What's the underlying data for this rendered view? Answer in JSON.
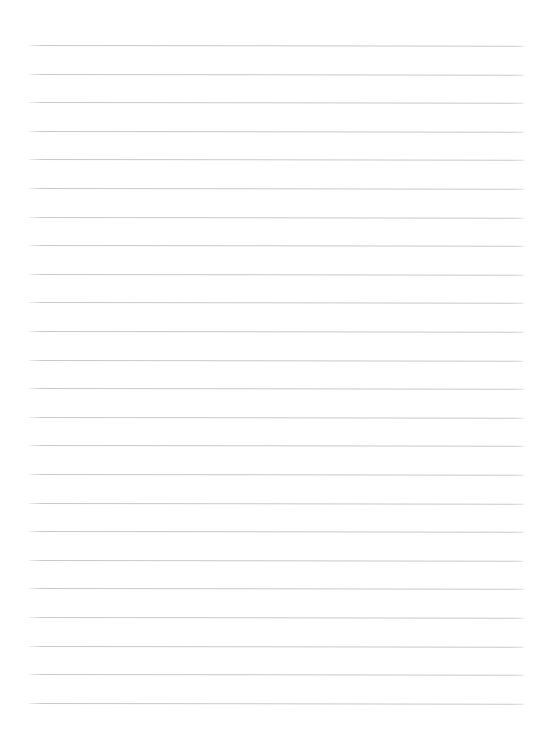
{
  "document": {
    "kind": "lined-paper",
    "title": "",
    "body_text": "",
    "is_blank": true
  },
  "page": {
    "width": 534,
    "height": 743,
    "background_color": "#ffffff"
  },
  "ruling": {
    "line_color": "#c9c9cd",
    "line_thickness_px": 1,
    "line_count": 24,
    "first_line_y": 45,
    "line_spacing_px": 28.6,
    "left_margin_x": 27,
    "right_margin_x": 525,
    "line_width_px": 498,
    "skew_degrees": 0.075,
    "top_margin_px": 45,
    "bottom_margin_px": 40,
    "line_y_positions": [
      45,
      73.6,
      102.2,
      130.8,
      159.4,
      188,
      216.6,
      245.2,
      273.8,
      302.4,
      331,
      359.6,
      388.2,
      416.8,
      445.4,
      474,
      502.6,
      531.2,
      559.8,
      588.4,
      617,
      645.6,
      674.2,
      702.8
    ]
  }
}
